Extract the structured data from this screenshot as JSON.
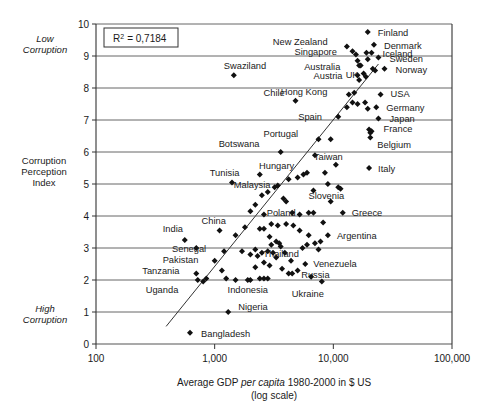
{
  "chart_data": {
    "type": "scatter",
    "title": "",
    "xlabel": "Average GDP per capita 1980-2000 in $ US (log scale)",
    "ylabel": "Corruption Perception Index",
    "xscale": "log",
    "xlim": [
      100,
      100000
    ],
    "ylim": [
      0,
      10
    ],
    "xticks": [
      "100",
      "1,000",
      "10,000",
      "100,000"
    ],
    "yticks": [
      "0",
      "1",
      "2",
      "3",
      "4",
      "5",
      "6",
      "7",
      "8",
      "9",
      "10"
    ],
    "grid": true,
    "annotation_r2": "R",
    "annotation_r2_sup": "2",
    "annotation_r2_value": "= 0,7184",
    "y_axis_top_note": "Low\nCorruption",
    "y_axis_bottom_note": "High\nCorruption",
    "y_axis_mid_note": "Corruption\nPerception\nIndex",
    "xlabel_part1": "Average GDP ",
    "xlabel_part2": "per capita",
    "xlabel_part3": " 1980-2000 in $ US",
    "xlabel_part4": "(log scale)",
    "trendline": {
      "x1": 390,
      "y1": 0.55,
      "x2": 24000,
      "y2": 8.75
    },
    "labeled_points": [
      {
        "label": "Finland",
        "x": 19500,
        "y": 9.75,
        "lx": 10,
        "ly": 4
      },
      {
        "label": "New Zealand",
        "x": 13000,
        "y": 9.3,
        "lx": -74,
        "ly": -1
      },
      {
        "label": "Denmark",
        "x": 22000,
        "y": 9.35,
        "lx": 10,
        "ly": 4
      },
      {
        "label": "Singapore",
        "x": 14500,
        "y": 9.15,
        "lx": -58,
        "ly": 4
      },
      {
        "label": "Iceland",
        "x": 21000,
        "y": 9.1,
        "lx": 11,
        "ly": 4
      },
      {
        "label": "Sweden",
        "x": 24000,
        "y": 8.95,
        "lx": 11,
        "ly": 4
      },
      {
        "label": "Australia",
        "x": 16500,
        "y": 8.7,
        "lx": -55,
        "ly": 4
      },
      {
        "label": "Norway",
        "x": 27000,
        "y": 8.6,
        "lx": 11,
        "ly": 4
      },
      {
        "label": "UK",
        "x": 18000,
        "y": 8.45,
        "lx": -18,
        "ly": 4
      },
      {
        "label": "Austria",
        "x": 16000,
        "y": 8.4,
        "lx": -44,
        "ly": 4
      },
      {
        "label": "Swaziland",
        "x": 1450,
        "y": 8.4,
        "lx": -10,
        "ly": -6
      },
      {
        "label": "Hong Kong",
        "x": 13500,
        "y": 7.8,
        "lx": -68,
        "ly": 1
      },
      {
        "label": "USA",
        "x": 25000,
        "y": 7.8,
        "lx": 10,
        "ly": 3
      },
      {
        "label": "Chile",
        "x": 4800,
        "y": 7.6,
        "lx": -32,
        "ly": -5
      },
      {
        "label": "Germany",
        "x": 23000,
        "y": 7.4,
        "lx": 10,
        "ly": 4
      },
      {
        "label": "Spain",
        "x": 11000,
        "y": 7.1,
        "lx": -40,
        "ly": 3
      },
      {
        "label": "Japan",
        "x": 24000,
        "y": 7.05,
        "lx": 11,
        "ly": 4
      },
      {
        "label": "France",
        "x": 21000,
        "y": 6.65,
        "lx": 12,
        "ly": 1
      },
      {
        "label": "Portugal",
        "x": 7500,
        "y": 6.4,
        "lx": -55,
        "ly": -2
      },
      {
        "label": "Belgium",
        "x": 20500,
        "y": 6.45,
        "lx": 7,
        "ly": 10
      },
      {
        "label": "Botswana",
        "x": 3600,
        "y": 6.0,
        "lx": -62,
        "ly": -5
      },
      {
        "label": "Taiwan",
        "x": 10500,
        "y": 5.6,
        "lx": -22,
        "ly": -5
      },
      {
        "label": "Italy",
        "x": 20000,
        "y": 5.5,
        "lx": 9,
        "ly": 4
      },
      {
        "label": "Hungary",
        "x": 6000,
        "y": 5.35,
        "lx": -48,
        "ly": -4
      },
      {
        "label": "Tunisia",
        "x": 2400,
        "y": 5.3,
        "lx": -50,
        "ly": 2
      },
      {
        "label": "Malaysia",
        "x": 3400,
        "y": 4.95,
        "lx": -44,
        "ly": 2
      },
      {
        "label": "Slovenia",
        "x": 11500,
        "y": 4.85,
        "lx": -32,
        "ly": 10
      },
      {
        "label": "Poland",
        "x": 6200,
        "y": 4.1,
        "lx": -42,
        "ly": 3
      },
      {
        "label": "Greece",
        "x": 12000,
        "y": 4.1,
        "lx": 9,
        "ly": 3
      },
      {
        "label": "China",
        "x": 1100,
        "y": 3.55,
        "lx": -18,
        "ly": -6
      },
      {
        "label": "India",
        "x": 560,
        "y": 3.25,
        "lx": -22,
        "ly": -8
      },
      {
        "label": "Argentina",
        "x": 9000,
        "y": 3.4,
        "lx": 9,
        "ly": 4
      },
      {
        "label": "Thailand",
        "x": 3000,
        "y": 3.1,
        "lx": -8,
        "ly": 12
      },
      {
        "label": "Senegal",
        "x": 1200,
        "y": 2.9,
        "lx": -52,
        "ly": 1
      },
      {
        "label": "Pakistan",
        "x": 1000,
        "y": 2.6,
        "lx": -52,
        "ly": 2
      },
      {
        "label": "Venezuela",
        "x": 5800,
        "y": 2.5,
        "lx": 8,
        "ly": 3
      },
      {
        "label": "Tanzania",
        "x": 700,
        "y": 2.2,
        "lx": -54,
        "ly": 0
      },
      {
        "label": "Russia",
        "x": 4500,
        "y": 2.2,
        "lx": 9,
        "ly": 4
      },
      {
        "label": "Uganda",
        "x": 720,
        "y": 2.0,
        "lx": -52,
        "ly": 13
      },
      {
        "label": "Indonesia",
        "x": 1500,
        "y": 2.0,
        "lx": -8,
        "ly": 13
      },
      {
        "label": "Ukraine",
        "x": 8000,
        "y": 1.95,
        "lx": -30,
        "ly": 15
      },
      {
        "label": "Nigeria",
        "x": 1300,
        "y": 1.0,
        "lx": 10,
        "ly": -2
      },
      {
        "label": "Bangladesh",
        "x": 620,
        "y": 0.35,
        "lx": 11,
        "ly": 4
      }
    ],
    "unlabeled_points": [
      {
        "x": 15500,
        "y": 9.05
      },
      {
        "x": 19000,
        "y": 9.1
      },
      {
        "x": 19500,
        "y": 8.9
      },
      {
        "x": 16000,
        "y": 8.85
      },
      {
        "x": 17000,
        "y": 8.7
      },
      {
        "x": 21500,
        "y": 8.6
      },
      {
        "x": 22500,
        "y": 8.55
      },
      {
        "x": 18800,
        "y": 8.35
      },
      {
        "x": 16500,
        "y": 8.25
      },
      {
        "x": 15000,
        "y": 7.85
      },
      {
        "x": 14500,
        "y": 7.55
      },
      {
        "x": 16000,
        "y": 7.5
      },
      {
        "x": 18500,
        "y": 7.55
      },
      {
        "x": 13000,
        "y": 7.4
      },
      {
        "x": 19500,
        "y": 7.35
      },
      {
        "x": 20000,
        "y": 6.7
      },
      {
        "x": 20500,
        "y": 6.6
      },
      {
        "x": 9500,
        "y": 6.4
      },
      {
        "x": 7000,
        "y": 5.9
      },
      {
        "x": 8500,
        "y": 5.35
      },
      {
        "x": 5600,
        "y": 5.3
      },
      {
        "x": 5000,
        "y": 5.2
      },
      {
        "x": 4200,
        "y": 5.15
      },
      {
        "x": 9000,
        "y": 5.0
      },
      {
        "x": 3200,
        "y": 4.9
      },
      {
        "x": 2800,
        "y": 4.75
      },
      {
        "x": 6800,
        "y": 4.8
      },
      {
        "x": 2500,
        "y": 4.65
      },
      {
        "x": 3800,
        "y": 4.55
      },
      {
        "x": 4000,
        "y": 4.45
      },
      {
        "x": 2200,
        "y": 4.35
      },
      {
        "x": 2000,
        "y": 4.15
      },
      {
        "x": 2600,
        "y": 4.05
      },
      {
        "x": 4500,
        "y": 4.1
      },
      {
        "x": 5200,
        "y": 4.05
      },
      {
        "x": 6800,
        "y": 4.1
      },
      {
        "x": 3000,
        "y": 3.75
      },
      {
        "x": 3400,
        "y": 3.7
      },
      {
        "x": 4000,
        "y": 3.75
      },
      {
        "x": 4600,
        "y": 3.7
      },
      {
        "x": 2400,
        "y": 3.6
      },
      {
        "x": 1800,
        "y": 3.65
      },
      {
        "x": 2600,
        "y": 3.6
      },
      {
        "x": 5200,
        "y": 3.55
      },
      {
        "x": 1500,
        "y": 3.4
      },
      {
        "x": 6200,
        "y": 3.4
      },
      {
        "x": 2900,
        "y": 3.35
      },
      {
        "x": 3300,
        "y": 3.2
      },
      {
        "x": 3500,
        "y": 3.15
      },
      {
        "x": 3600,
        "y": 3.05
      },
      {
        "x": 2200,
        "y": 2.95
      },
      {
        "x": 2500,
        "y": 2.85
      },
      {
        "x": 2800,
        "y": 2.9
      },
      {
        "x": 3100,
        "y": 2.85
      },
      {
        "x": 1700,
        "y": 2.9
      },
      {
        "x": 3900,
        "y": 2.85
      },
      {
        "x": 2300,
        "y": 2.75
      },
      {
        "x": 2000,
        "y": 2.8
      },
      {
        "x": 3300,
        "y": 2.7
      },
      {
        "x": 4400,
        "y": 2.6
      },
      {
        "x": 2600,
        "y": 2.55
      },
      {
        "x": 2900,
        "y": 2.45
      },
      {
        "x": 2200,
        "y": 2.4
      },
      {
        "x": 3700,
        "y": 2.35
      },
      {
        "x": 1150,
        "y": 2.3
      },
      {
        "x": 5000,
        "y": 2.3
      },
      {
        "x": 2400,
        "y": 2.05
      },
      {
        "x": 2600,
        "y": 2.05
      },
      {
        "x": 2800,
        "y": 2.05
      },
      {
        "x": 2000,
        "y": 2.0
      },
      {
        "x": 800,
        "y": 1.95
      },
      {
        "x": 850,
        "y": 2.05
      },
      {
        "x": 6500,
        "y": 2.1
      },
      {
        "x": 1250,
        "y": 2.05
      },
      {
        "x": 4200,
        "y": 2.2
      },
      {
        "x": 1900,
        "y": 2.0
      },
      {
        "x": 5500,
        "y": 3.0
      },
      {
        "x": 7000,
        "y": 3.15
      },
      {
        "x": 6000,
        "y": 3.1
      },
      {
        "x": 7500,
        "y": 2.95
      },
      {
        "x": 7800,
        "y": 3.2
      },
      {
        "x": 8200,
        "y": 3.8
      },
      {
        "x": 9500,
        "y": 4.45
      },
      {
        "x": 11000,
        "y": 4.9
      },
      {
        "x": 1400,
        "y": 5.05
      },
      {
        "x": 700,
        "y": 3.0
      }
    ]
  }
}
